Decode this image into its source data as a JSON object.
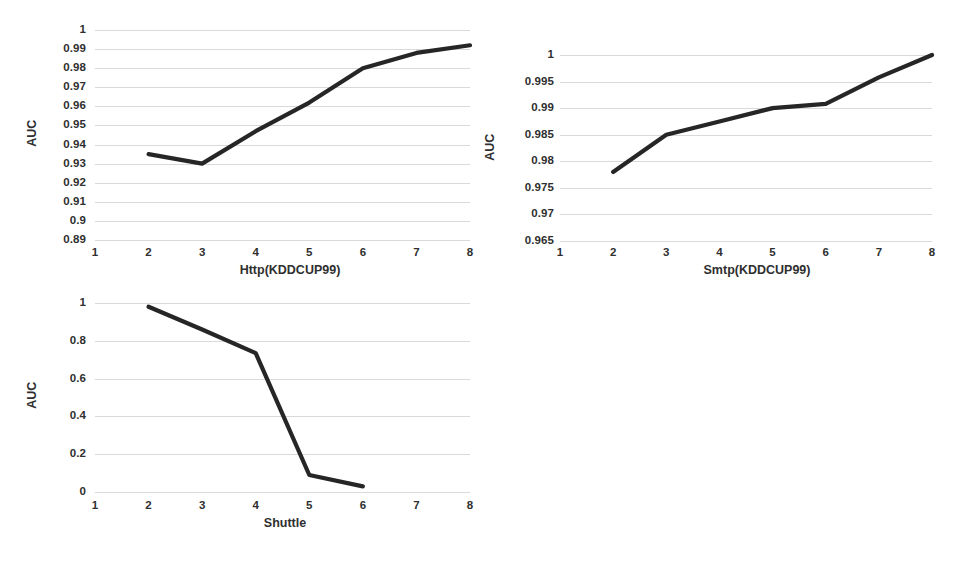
{
  "page": {
    "background_color": "#ffffff",
    "line_color": "#262626",
    "gridline_color": "#d9d9d9",
    "text_color": "#2f2f2f"
  },
  "charts": [
    {
      "id": "http",
      "ylabel": "AUC",
      "xlabel": "Http(KDDCUP99)",
      "xticks": [
        "1",
        "2",
        "3",
        "4",
        "5",
        "6",
        "7",
        "8"
      ],
      "yticks": [
        "1",
        "0.99",
        "0.98",
        "0.97",
        "0.96",
        "0.95",
        "0.94",
        "0.93",
        "0.92",
        "0.91",
        "0.9",
        "0.89"
      ]
    },
    {
      "id": "smtp",
      "ylabel": "AUC",
      "xlabel": "Smtp(KDDCUP99)",
      "xticks": [
        "1",
        "2",
        "3",
        "4",
        "5",
        "6",
        "7",
        "8"
      ],
      "yticks": [
        "1",
        "0.995",
        "0.99",
        "0.985",
        "0.98",
        "0.975",
        "0.97",
        "0.965"
      ]
    },
    {
      "id": "shuttle",
      "ylabel": "AUC",
      "xlabel": "Shuttle",
      "xticks": [
        "1",
        "2",
        "3",
        "4",
        "5",
        "6",
        "7",
        "8"
      ],
      "yticks": [
        "1",
        "0.8",
        "0.6",
        "0.4",
        "0.2",
        "0"
      ]
    }
  ],
  "chart_data": [
    {
      "type": "line",
      "id": "http",
      "title": "",
      "xlabel": "Http(KDDCUP99)",
      "ylabel": "AUC",
      "x": [
        2,
        3,
        4,
        5,
        6,
        7,
        8
      ],
      "values": [
        0.935,
        0.93,
        0.947,
        0.962,
        0.98,
        0.988,
        0.992
      ],
      "xlim": [
        1,
        8
      ],
      "ylim": [
        0.89,
        1
      ],
      "xticks": [
        1,
        2,
        3,
        4,
        5,
        6,
        7,
        8
      ],
      "yticks": [
        1,
        0.99,
        0.98,
        0.97,
        0.96,
        0.95,
        0.94,
        0.93,
        0.92,
        0.91,
        0.9,
        0.89
      ],
      "grid": true,
      "legend": null
    },
    {
      "type": "line",
      "id": "smtp",
      "title": "",
      "xlabel": "Smtp(KDDCUP99)",
      "ylabel": "AUC",
      "x": [
        2,
        3,
        4,
        5,
        6,
        7,
        8
      ],
      "values": [
        0.978,
        0.985,
        0.9875,
        0.99,
        0.9908,
        0.9958,
        1.0
      ],
      "xlim": [
        1,
        8
      ],
      "ylim": [
        0.965,
        1
      ],
      "xticks": [
        1,
        2,
        3,
        4,
        5,
        6,
        7,
        8
      ],
      "yticks": [
        1,
        0.995,
        0.99,
        0.985,
        0.98,
        0.975,
        0.97,
        0.965
      ],
      "grid": true,
      "legend": null
    },
    {
      "type": "line",
      "id": "shuttle",
      "title": "",
      "xlabel": "Shuttle",
      "ylabel": "AUC",
      "x": [
        2,
        3,
        4,
        5,
        6
      ],
      "values": [
        0.98,
        0.86,
        0.735,
        0.09,
        0.03
      ],
      "xlim": [
        1,
        8
      ],
      "ylim": [
        0,
        1
      ],
      "xticks": [
        1,
        2,
        3,
        4,
        5,
        6,
        7,
        8
      ],
      "yticks": [
        1,
        0.8,
        0.6,
        0.4,
        0.2,
        0
      ],
      "grid": true,
      "legend": null
    }
  ]
}
